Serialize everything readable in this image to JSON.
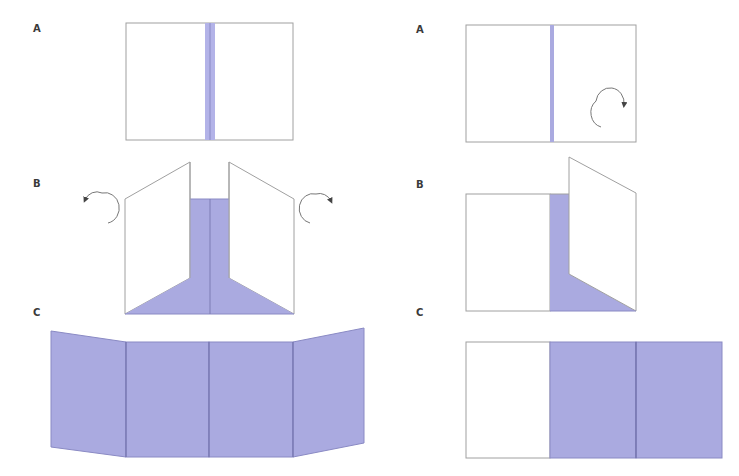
{
  "colors": {
    "fill_purple": "#aaaae0",
    "strip_purple": "#b3b3e8",
    "fold_line": "#7c7cb4",
    "outline_gray": "#a0a0a0",
    "arrow": "#555555",
    "label": "#3a3a3a"
  },
  "left_column": {
    "step_a": {
      "label": "A"
    },
    "step_b": {
      "label": "B"
    },
    "step_c": {
      "label": "C"
    }
  },
  "right_column": {
    "step_a": {
      "label": "A"
    },
    "step_b": {
      "label": "B"
    },
    "step_c": {
      "label": "C"
    }
  }
}
